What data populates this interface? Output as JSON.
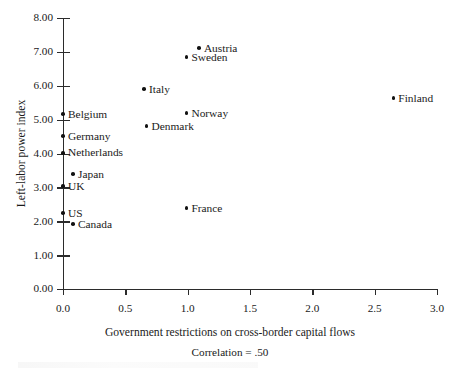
{
  "chart_data": {
    "type": "scatter",
    "title": "",
    "xlabel": "Government restrictions on cross-border capital flows",
    "ylabel": "Left-labor power index",
    "annotation": "Correlation = .50",
    "xlim": [
      0.0,
      3.0
    ],
    "ylim": [
      0.0,
      8.0
    ],
    "xticks": [
      "0.0",
      "0.5",
      "1.0",
      "1.5",
      "2.0",
      "2.5",
      "3.0"
    ],
    "xtick_values": [
      0.0,
      0.5,
      1.0,
      1.5,
      2.0,
      2.5,
      3.0
    ],
    "yticks": [
      "0.00",
      "1.00",
      "2.00",
      "3.00",
      "4.00",
      "5.00",
      "6.00",
      "7.00",
      "8.00"
    ],
    "ytick_values": [
      0.0,
      1.0,
      2.0,
      3.0,
      4.0,
      5.0,
      6.0,
      7.0,
      8.0
    ],
    "grid": false,
    "legend": "none",
    "points": [
      {
        "label": "Austria",
        "x": 1.09,
        "y": 7.11,
        "label_side": "right"
      },
      {
        "label": "Sweden",
        "x": 0.99,
        "y": 6.84,
        "label_side": "right"
      },
      {
        "label": "Italy",
        "x": 0.65,
        "y": 5.9,
        "label_side": "right"
      },
      {
        "label": "Finland",
        "x": 2.65,
        "y": 5.63,
        "label_side": "right"
      },
      {
        "label": "Norway",
        "x": 0.99,
        "y": 5.19,
        "label_side": "right"
      },
      {
        "label": "Belgium",
        "x": 0.0,
        "y": 5.16,
        "label_side": "right"
      },
      {
        "label": "Denmark",
        "x": 0.67,
        "y": 4.81,
        "label_side": "right"
      },
      {
        "label": "Germany",
        "x": 0.0,
        "y": 4.51,
        "label_side": "right"
      },
      {
        "label": "Netherlands",
        "x": 0.0,
        "y": 4.02,
        "label_side": "right"
      },
      {
        "label": "Japan",
        "x": 0.08,
        "y": 3.39,
        "label_side": "right"
      },
      {
        "label": "UK",
        "x": 0.0,
        "y": 3.04,
        "label_side": "right"
      },
      {
        "label": "France",
        "x": 0.99,
        "y": 2.39,
        "label_side": "right"
      },
      {
        "label": "US",
        "x": 0.0,
        "y": 2.24,
        "label_side": "right"
      },
      {
        "label": "Canada",
        "x": 0.08,
        "y": 1.92,
        "label_side": "right"
      }
    ]
  },
  "colors": {
    "marker": "#121212",
    "axis": "#2b2b2b",
    "text": "#1a1a1a",
    "background": "#ffffff"
  }
}
